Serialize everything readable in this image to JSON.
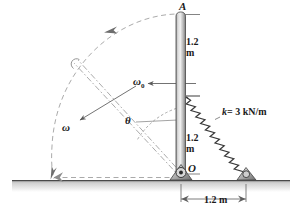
{
  "figure": {
    "labels": {
      "point_a": "A",
      "point_o": "O",
      "upper_length_value": "1.2",
      "upper_length_unit": "m",
      "lower_length_value": "1.2",
      "lower_length_unit": "m",
      "spring_constant": "k = 3 kN/m",
      "spring_symbol": "k",
      "spring_value": "= 3 kN/m",
      "angular_velocity_initial": "ω",
      "angular_velocity_initial_sub": "0",
      "angular_velocity": "ω",
      "angle": "θ",
      "base_dimension": "1.2 m"
    },
    "colors": {
      "rod_light": "#e8e8e8",
      "rod_dark": "#8d8d8d",
      "spring": "#3c3c3c",
      "ground": "#b7b7b7",
      "dashed": "#9a9a9a",
      "ink": "#1a1a1a"
    }
  }
}
